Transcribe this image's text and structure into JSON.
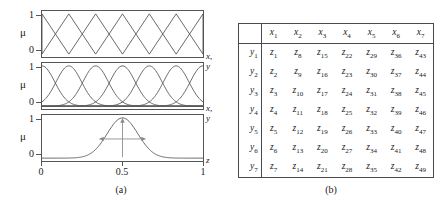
{
  "figure": {
    "panel_a": {
      "caption": "(a)",
      "y_axis_label": "μ",
      "y_ticks": [
        "1",
        "0"
      ],
      "x_ticks": [
        "0",
        "0.5",
        "1"
      ],
      "x_axis_labels": [
        "x, y",
        "x, y",
        "z"
      ],
      "plots": [
        {
          "id": "triangular-membership-plot",
          "mf_type": "triangular",
          "n_functions": 7,
          "x_axis_label": "x, y",
          "ylim": [
            0,
            1
          ]
        },
        {
          "id": "gaussian-membership-plot",
          "mf_type": "gaussian",
          "n_functions": 7,
          "x_axis_label": "x, y",
          "ylim": [
            0,
            1
          ]
        },
        {
          "id": "single-gaussian-plot",
          "mf_type": "gaussian",
          "n_functions": 1,
          "center": 0.5,
          "x_axis_label": "z",
          "ylim": [
            0,
            1
          ],
          "annotations": [
            "height-arrow",
            "width-arrow"
          ]
        }
      ]
    },
    "panel_b": {
      "caption": "(b)",
      "table": {
        "corner_label": "",
        "columns": [
          "x1",
          "x2",
          "x3",
          "x4",
          "x5",
          "x6",
          "x7"
        ],
        "column_base": "x",
        "column_subs": [
          "1",
          "2",
          "3",
          "4",
          "5",
          "6",
          "7"
        ],
        "row_base": "y",
        "row_subs": [
          "1",
          "2",
          "3",
          "4",
          "5",
          "6",
          "7"
        ],
        "cell_base": "z",
        "cells": [
          [
            "1",
            "8",
            "15",
            "22",
            "29",
            "36",
            "43"
          ],
          [
            "2",
            "9",
            "16",
            "23",
            "30",
            "37",
            "44"
          ],
          [
            "3",
            "10",
            "17",
            "24",
            "31",
            "38",
            "45"
          ],
          [
            "4",
            "11",
            "18",
            "25",
            "32",
            "39",
            "46"
          ],
          [
            "5",
            "12",
            "19",
            "26",
            "33",
            "40",
            "47"
          ],
          [
            "6",
            "13",
            "20",
            "27",
            "34",
            "41",
            "48"
          ],
          [
            "7",
            "14",
            "21",
            "28",
            "35",
            "42",
            "49"
          ]
        ]
      }
    }
  },
  "colors": {
    "line": "#555555",
    "frame": "#4a4a4a",
    "annotation": "#8a8a8a",
    "text": "#1a1a1a"
  }
}
